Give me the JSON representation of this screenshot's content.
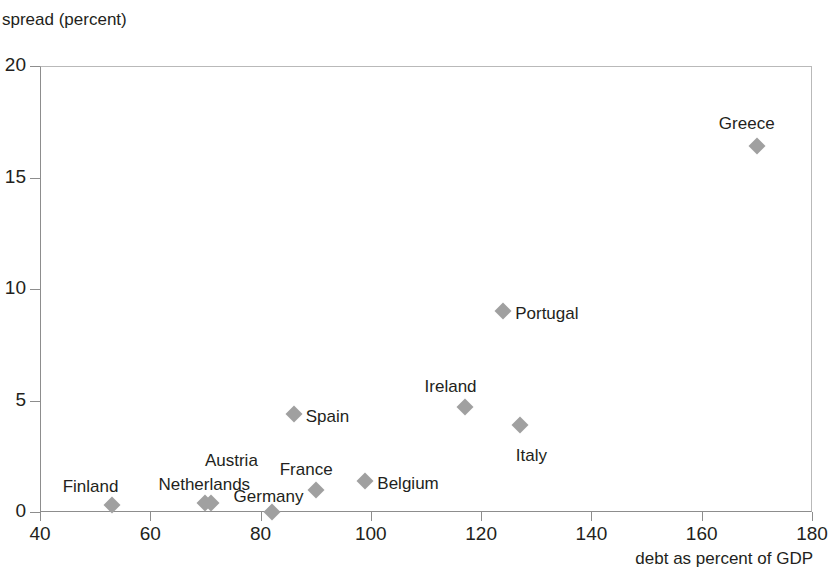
{
  "chart_data": {
    "type": "scatter",
    "title": "",
    "xlabel": "debt as percent of GDP",
    "ylabel": "spread (percent)",
    "xlim": [
      40,
      180
    ],
    "ylim": [
      0,
      20
    ],
    "xticks": [
      40,
      60,
      80,
      100,
      120,
      140,
      160,
      180
    ],
    "yticks": [
      0,
      5,
      10,
      15,
      20
    ],
    "grid": false,
    "legend": "none",
    "marker_color": "#a0a0a0",
    "marker_shape": "diamond",
    "points": [
      {
        "label": "Finland",
        "x": 53,
        "y": 0.3,
        "label_dx": -49,
        "label_dy": -28
      },
      {
        "label": "Netherlands",
        "x": 70,
        "y": 0.4,
        "label_dx": -47,
        "label_dy": -28
      },
      {
        "label": "Austria",
        "x": 71,
        "y": 0.4,
        "label_dx": -6,
        "label_dy": -52
      },
      {
        "label": "Germany",
        "x": 82,
        "y": 0.0,
        "label_dx": -38,
        "label_dy": -25
      },
      {
        "label": "France",
        "x": 90,
        "y": 1.0,
        "label_dx": -36,
        "label_dy": -30
      },
      {
        "label": "Belgium",
        "x": 99,
        "y": 1.4,
        "label_dx": 12,
        "label_dy": -7
      },
      {
        "label": "Spain",
        "x": 86,
        "y": 4.4,
        "label_dx": 12,
        "label_dy": -7
      },
      {
        "label": "Ireland",
        "x": 117,
        "y": 4.7,
        "label_dx": -40,
        "label_dy": -30
      },
      {
        "label": "Italy",
        "x": 127,
        "y": 3.9,
        "label_dx": -4,
        "label_dy": 21
      },
      {
        "label": "Portugal",
        "x": 124,
        "y": 9.0,
        "label_dx": 12,
        "label_dy": -7
      },
      {
        "label": "Greece",
        "x": 170,
        "y": 16.4,
        "label_dx": -38,
        "label_dy": -32
      }
    ]
  },
  "axes": {
    "y_title": "spread (percent)",
    "x_title": "debt as percent of GDP"
  }
}
